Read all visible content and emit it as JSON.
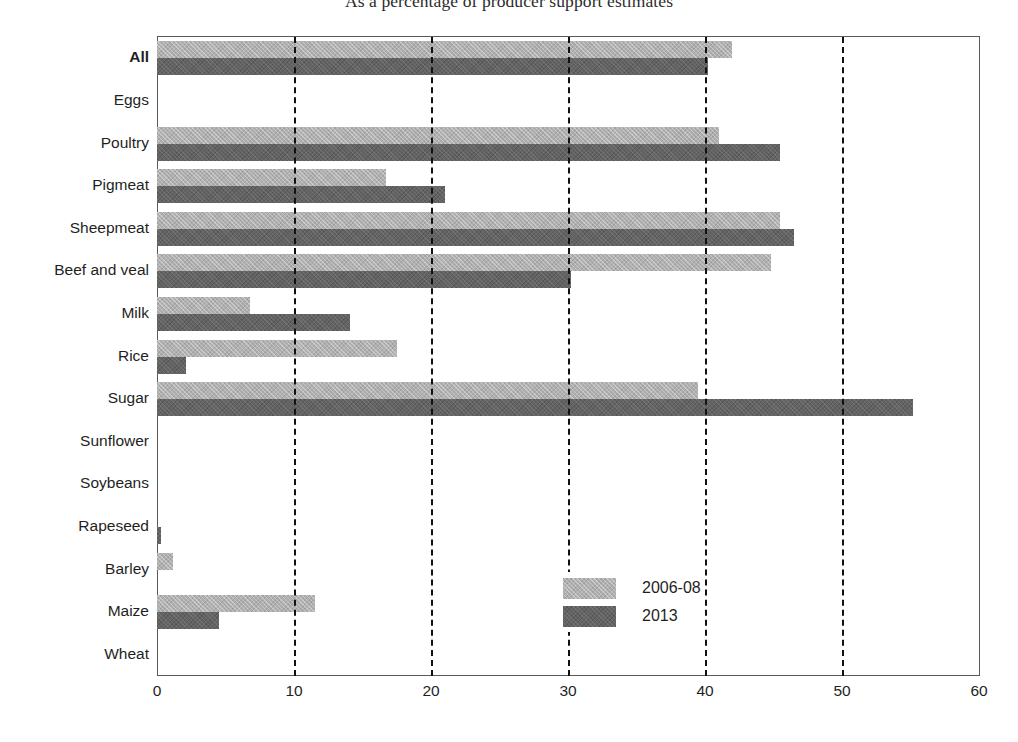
{
  "chart_data": {
    "type": "bar",
    "orientation": "horizontal",
    "title": "As a percentage of producer support estimates",
    "xlabel": "",
    "ylabel": "",
    "xlim": [
      0,
      60
    ],
    "xticks": [
      0,
      10,
      20,
      30,
      40,
      50,
      60
    ],
    "grid": "vertical dashed gridlines at 10, 20, 30, 40, 50",
    "legend_position": "inside lower-right of plot area",
    "categories": [
      "All",
      "Eggs",
      "Poultry",
      "Pigmeat",
      "Sheepmeat",
      "Beef and veal",
      "Milk",
      "Rice",
      "Sugar",
      "Sunflower",
      "Soybeans",
      "Rapeseed",
      "Barley",
      "Maize",
      "Wheat"
    ],
    "series": [
      {
        "name": "2006-08",
        "color": "#b0b0b0",
        "values": [
          42.0,
          0.0,
          41.0,
          16.7,
          45.5,
          44.8,
          6.8,
          17.5,
          39.5,
          0.0,
          0.0,
          0.0,
          1.2,
          11.5,
          0.0
        ]
      },
      {
        "name": "2013",
        "color": "#636363",
        "values": [
          40.2,
          0.0,
          45.5,
          21.0,
          46.5,
          30.2,
          14.1,
          2.1,
          55.2,
          0.0,
          0.0,
          0.3,
          0.0,
          4.5,
          0.0
        ]
      }
    ]
  },
  "legend": {
    "items": [
      {
        "label": "2006-08"
      },
      {
        "label": "2013"
      }
    ]
  },
  "footnote": {
    "text": ""
  }
}
